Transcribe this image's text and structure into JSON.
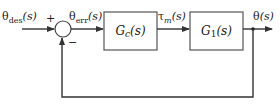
{
  "diagram": {
    "type": "feedback-control-block-diagram",
    "colors": {
      "line": "#333333",
      "block_border": "#555555",
      "background": "#ffffff"
    },
    "signals": {
      "input": {
        "symbol": "θ",
        "subscript": "des",
        "arg": "(s)"
      },
      "error": {
        "symbol": "θ",
        "subscript": "err",
        "arg": "(s)"
      },
      "torque": {
        "symbol": "τ",
        "subscript": "m",
        "arg": "(s)"
      },
      "output": {
        "symbol": "θ",
        "arg": "(s)"
      }
    },
    "summing_junction": {
      "plus_sign": "+",
      "minus_sign": "−"
    },
    "blocks": [
      {
        "id": "controller",
        "name": "G",
        "subscript": "c",
        "arg": "(s)"
      },
      {
        "id": "plant",
        "name": "G",
        "subscript": "1",
        "arg": "(s)"
      }
    ],
    "feedback": "unity negative feedback from θ(s) to summing junction"
  }
}
